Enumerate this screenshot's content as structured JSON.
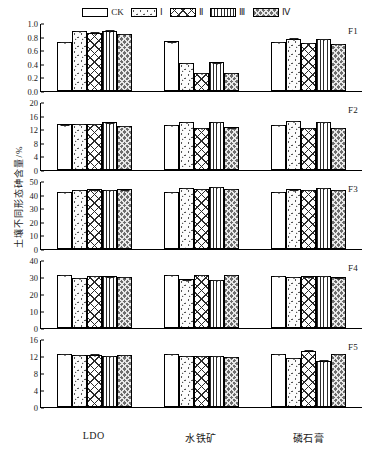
{
  "legend": {
    "items": [
      {
        "label": "CK",
        "pattern": "empty"
      },
      {
        "label": "Ⅰ",
        "pattern": "sparse-dots"
      },
      {
        "label": "Ⅱ",
        "pattern": "cross-hatch"
      },
      {
        "label": "Ⅲ",
        "pattern": "vertical-lines"
      },
      {
        "label": "Ⅳ",
        "pattern": "dense-checker"
      }
    ]
  },
  "axis": {
    "ylabel": "土壤不同形态砷含量/%",
    "xcategories": [
      "LDO",
      "水铁矿",
      "磷石膏"
    ]
  },
  "chart_data": {
    "type": "bar",
    "title": "",
    "xlabel": "",
    "ylabel": "土壤不同形态砷含量/%",
    "categories": [
      "LDO",
      "水铁矿",
      "磷石膏"
    ],
    "series_names": [
      "CK",
      "Ⅰ",
      "Ⅱ",
      "Ⅲ",
      "Ⅳ"
    ],
    "panels": [
      {
        "code": "F1",
        "ylim": [
          0,
          1.0
        ],
        "yticks": [
          "0.0",
          "0.2",
          "0.4",
          "0.6",
          "0.8",
          "1.0"
        ],
        "ytick_values": [
          0,
          0.2,
          0.4,
          0.6,
          0.8,
          1.0
        ],
        "groups": [
          {
            "category": "LDO",
            "values": [
              0.72,
              0.88,
              0.86,
              0.88,
              0.84
            ],
            "errors": [
              0.01,
              0.02,
              0.02,
              0.03,
              0.01
            ]
          },
          {
            "category": "水铁矿",
            "values": [
              0.73,
              0.41,
              0.27,
              0.42,
              0.27
            ],
            "errors": [
              0.01,
              0.01,
              0.01,
              0.01,
              0.01
            ]
          },
          {
            "category": "磷石膏",
            "values": [
              0.72,
              0.77,
              0.71,
              0.77,
              0.69
            ],
            "errors": [
              0.01,
              0.02,
              0.01,
              0.01,
              0.01
            ]
          }
        ]
      },
      {
        "code": "F2",
        "ylim": [
          0,
          20
        ],
        "yticks": [
          "0",
          "4",
          "8",
          "12",
          "16",
          "20"
        ],
        "ytick_values": [
          0,
          4,
          8,
          12,
          16,
          20
        ],
        "groups": [
          {
            "category": "LDO",
            "values": [
              13.4,
              13.6,
              13.6,
              14.0,
              13.0
            ],
            "errors": [
              0.2,
              0.2,
              0.2,
              0.2,
              0.3
            ]
          },
          {
            "category": "水铁矿",
            "values": [
              13.3,
              14.2,
              12.4,
              14.2,
              12.6
            ],
            "errors": [
              0.2,
              0.3,
              0.2,
              0.2,
              0.2
            ]
          },
          {
            "category": "磷石膏",
            "values": [
              13.2,
              14.4,
              12.5,
              14.2,
              12.5
            ],
            "errors": [
              0.2,
              0.3,
              0.2,
              0.2,
              0.2
            ]
          }
        ]
      },
      {
        "code": "F3",
        "ylim": [
          0,
          50
        ],
        "yticks": [
          "0",
          "10",
          "20",
          "30",
          "40",
          "50"
        ],
        "ytick_values": [
          0,
          10,
          20,
          30,
          40,
          50
        ],
        "groups": [
          {
            "category": "LDO",
            "values": [
              42.0,
              43.2,
              43.8,
              43.6,
              43.8
            ],
            "errors": [
              0.5,
              0.6,
              0.5,
              0.5,
              0.5
            ]
          },
          {
            "category": "水铁矿",
            "values": [
              41.8,
              44.8,
              44.4,
              45.4,
              44.2
            ],
            "errors": [
              0.5,
              0.6,
              0.6,
              0.6,
              0.5
            ]
          },
          {
            "category": "磷石膏",
            "values": [
              42.2,
              44.0,
              43.6,
              44.8,
              43.6
            ],
            "errors": [
              0.5,
              0.5,
              0.5,
              0.6,
              0.5
            ]
          }
        ]
      },
      {
        "code": "F4",
        "ylim": [
          0,
          40
        ],
        "yticks": [
          "0",
          "10",
          "20",
          "30",
          "40"
        ],
        "ytick_values": [
          0,
          10,
          20,
          30,
          40
        ],
        "groups": [
          {
            "category": "LDO",
            "values": [
              31.0,
              29.6,
              30.6,
              30.4,
              30.0
            ],
            "errors": [
              0.5,
              0.4,
              0.4,
              0.4,
              0.4
            ]
          },
          {
            "category": "水铁矿",
            "values": [
              31.0,
              28.6,
              31.2,
              28.4,
              31.4
            ],
            "errors": [
              0.5,
              0.4,
              0.5,
              0.4,
              0.4
            ]
          },
          {
            "category": "磷石膏",
            "values": [
              30.8,
              30.2,
              30.4,
              30.6,
              29.8
            ],
            "errors": [
              0.5,
              0.4,
              0.4,
              0.4,
              0.4
            ]
          }
        ]
      },
      {
        "code": "F5",
        "ylim": [
          0,
          16
        ],
        "yticks": [
          "0",
          "4",
          "8",
          "12",
          "16"
        ],
        "ytick_values": [
          0,
          4,
          8,
          12,
          16
        ],
        "groups": [
          {
            "category": "LDO",
            "values": [
              12.4,
              12.2,
              12.3,
              12.0,
              12.2
            ],
            "errors": [
              0.4,
              0.2,
              0.3,
              0.2,
              0.2
            ]
          },
          {
            "category": "水铁矿",
            "values": [
              12.4,
              12.0,
              12.0,
              12.1,
              11.8
            ],
            "errors": [
              0.4,
              0.2,
              0.2,
              0.2,
              0.3
            ]
          },
          {
            "category": "磷石膏",
            "values": [
              12.4,
              11.6,
              13.2,
              10.9,
              12.5
            ],
            "errors": [
              0.3,
              0.2,
              0.4,
              0.3,
              0.2
            ]
          }
        ]
      }
    ]
  }
}
